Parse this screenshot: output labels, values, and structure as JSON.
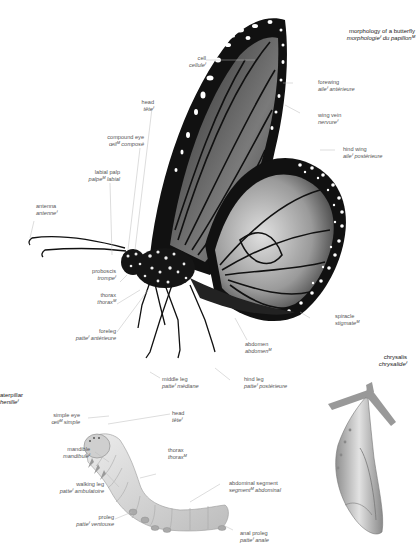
{
  "butterfly": {
    "title": {
      "en": "morphology of a butterfly",
      "fr": "morphologieᶠ du papillonᴹ"
    },
    "labels": {
      "cell": {
        "en": "cell",
        "fr": "celluleᶠ"
      },
      "head": {
        "en": "head",
        "fr": "têteᶠ"
      },
      "compound_eye": {
        "en": "compound eye",
        "fr": "œilᴹ composé"
      },
      "labial_palp": {
        "en": "labial palp",
        "fr": "palpeᴹ labial"
      },
      "antenna": {
        "en": "antenna",
        "fr": "antenneᶠ"
      },
      "forewing": {
        "en": "forewing",
        "fr": "aileᶠ antérieure"
      },
      "wing_vein": {
        "en": "wing vein",
        "fr": "nervureᶠ"
      },
      "hind_wing": {
        "en": "hind wing",
        "fr": "aileᶠ postérieure"
      },
      "proboscis": {
        "en": "proboscis",
        "fr": "trompeᶠ"
      },
      "thorax": {
        "en": "thorax",
        "fr": "thoraxᴹ"
      },
      "foreleg": {
        "en": "foreleg",
        "fr": "patteᶠ antérieure"
      },
      "spiracle": {
        "en": "spiracle",
        "fr": "stigmateᴹ"
      },
      "abdomen": {
        "en": "abdomen",
        "fr": "abdomenᴹ"
      },
      "middle_leg": {
        "en": "middle leg",
        "fr": "patteᶠ médiane"
      },
      "hind_leg": {
        "en": "hind leg",
        "fr": "patteᶠ postérieure"
      }
    }
  },
  "caterpillar": {
    "title": {
      "en": "caterpillar",
      "fr": "chenilleᶠ"
    },
    "labels": {
      "simple_eye": {
        "en": "simple eye",
        "fr": "œilᴹ simple"
      },
      "head": {
        "en": "head",
        "fr": "têteᶠ"
      },
      "mandible": {
        "en": "mandible",
        "fr": "mandibuleᶠ"
      },
      "thorax": {
        "en": "thorax",
        "fr": "thoraxᴹ"
      },
      "walking_leg": {
        "en": "walking leg",
        "fr": "patteᶠ ambulatoire"
      },
      "abdominal_segment": {
        "en": "abdominal segment",
        "fr": "segmentᴹ abdominal"
      },
      "proleg": {
        "en": "proleg",
        "fr": "patteᶠ ventouse"
      },
      "anal_proleg": {
        "en": "anal proleg",
        "fr": "patteᶠ anale"
      }
    }
  },
  "chrysalis": {
    "title": {
      "en": "chrysalis",
      "fr": "chrysalideᶠ"
    }
  },
  "colors": {
    "wing_black": "#111111",
    "wing_gray": "#8a8a8a",
    "spot_white": "#ffffff",
    "caterpillar": "#d8d8d8",
    "chrysalis": "#bdbdbd",
    "leader": "#bbbbbb",
    "text": "#555555"
  }
}
